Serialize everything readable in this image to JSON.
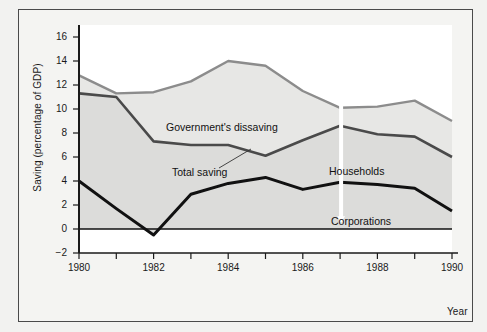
{
  "figure": {
    "y_axis_title": "Saving (percentage of GDP)",
    "x_axis_title": "Year"
  },
  "annotations": {
    "government": "Government's dissaving",
    "total": "Total saving",
    "households": "Households",
    "corporations": "Corporations"
  },
  "colors": {
    "gross_line": "#8c8c8c",
    "total_line": "#4a4a4a",
    "corporations_line": "#111111",
    "band_fill": "#dcdcda",
    "plot_background": "#ffffff",
    "page_background": "#f2f2f0",
    "frame_border": "#4a4a4a"
  },
  "chart_data": {
    "type": "area",
    "title": "",
    "xlabel": "Year",
    "ylabel": "Saving (percentage of GDP)",
    "xlim": [
      1980,
      1990
    ],
    "ylim": [
      -2,
      17
    ],
    "yticks": [
      -2,
      0,
      2,
      4,
      6,
      8,
      10,
      12,
      14,
      16
    ],
    "xticks": [
      1980,
      1981,
      1982,
      1983,
      1984,
      1985,
      1986,
      1987,
      1988,
      1989,
      1990
    ],
    "xtick_labels": [
      "1980",
      "",
      "1982",
      "",
      "1984",
      "",
      "1986",
      "",
      "1988",
      "",
      "1990"
    ],
    "grid": false,
    "legend": "inline-annotations",
    "x": [
      1980,
      1981,
      1982,
      1983,
      1984,
      1985,
      1986,
      1987,
      1988,
      1989,
      1990
    ],
    "series": [
      {
        "name": "Gross private saving (top of government's dissaving band)",
        "label": "Government's dissaving",
        "color": "#8c8c8c",
        "values": [
          12.8,
          11.3,
          11.4,
          12.3,
          14.0,
          13.6,
          11.5,
          10.1,
          10.2,
          10.7,
          9.0
        ]
      },
      {
        "name": "Total saving",
        "label": "Total saving",
        "color": "#4a4a4a",
        "values": [
          11.3,
          11.0,
          7.3,
          7.0,
          7.0,
          6.1,
          7.4,
          8.6,
          7.9,
          7.7,
          6.0
        ]
      },
      {
        "name": "Corporations",
        "label": "Corporations",
        "color": "#111111",
        "values": [
          4.0,
          1.7,
          -0.5,
          2.9,
          3.8,
          4.3,
          3.3,
          3.9,
          3.7,
          3.4,
          1.5
        ]
      }
    ],
    "bands": [
      {
        "name": "Households",
        "upper_series": "Total saving",
        "lower_series": "Corporations",
        "fill": "#dcdcda"
      },
      {
        "name": "Government's dissaving",
        "upper_series": "Gross private saving (top of government's dissaving band)",
        "lower_series": "Total saving",
        "fill": "#e8e8e6"
      },
      {
        "name": "Corporations",
        "upper_series": "Corporations",
        "lower_series": "zero",
        "fill": "#dcdcda"
      }
    ]
  }
}
